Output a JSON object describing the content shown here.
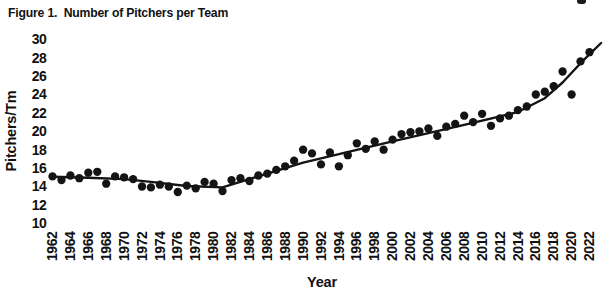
{
  "figure": {
    "title": "Figure 1.  Number of Pitchers per Team"
  },
  "chart_data": {
    "type": "scatter",
    "title": "Figure 1. Number of Pitchers per Team",
    "xlabel": "Year",
    "ylabel": "Pitchers/Tm",
    "xlim": [
      1960.5,
      2023.5
    ],
    "ylim": [
      10,
      30
    ],
    "yticks": [
      10,
      12,
      14,
      16,
      18,
      20,
      22,
      24,
      26,
      28,
      30
    ],
    "xticks": [
      1962,
      1964,
      1966,
      1968,
      1970,
      1972,
      1974,
      1976,
      1978,
      1980,
      1982,
      1984,
      1986,
      1988,
      1990,
      1992,
      1994,
      1996,
      1998,
      2000,
      2002,
      2004,
      2006,
      2008,
      2010,
      2012,
      2014,
      2016,
      2018,
      2020,
      2022
    ],
    "grid": false,
    "legend": "none",
    "point_color": "#141414",
    "line_color": "#141414",
    "series": [
      {
        "name": "pitchers-per-team-by-year",
        "type": "scatter",
        "x": [
          1962,
          1963,
          1964,
          1965,
          1966,
          1967,
          1968,
          1969,
          1970,
          1971,
          1972,
          1973,
          1974,
          1975,
          1976,
          1977,
          1978,
          1979,
          1980,
          1981,
          1982,
          1983,
          1984,
          1985,
          1986,
          1987,
          1988,
          1989,
          1990,
          1991,
          1992,
          1993,
          1994,
          1995,
          1996,
          1997,
          1998,
          1999,
          2000,
          2001,
          2002,
          2003,
          2004,
          2005,
          2006,
          2007,
          2008,
          2009,
          2010,
          2011,
          2012,
          2013,
          2014,
          2015,
          2016,
          2017,
          2018,
          2019,
          2020,
          2021,
          2022
        ],
        "y": [
          15.1,
          14.7,
          15.2,
          14.9,
          15.5,
          15.6,
          14.3,
          15.1,
          15.0,
          14.8,
          14.0,
          13.9,
          14.2,
          14.0,
          13.4,
          14.1,
          13.8,
          14.5,
          14.3,
          13.5,
          14.7,
          14.9,
          14.6,
          15.2,
          15.4,
          15.8,
          16.2,
          16.8,
          18.0,
          17.6,
          16.4,
          17.7,
          16.2,
          17.4,
          18.7,
          18.1,
          18.9,
          18.0,
          19.1,
          19.7,
          19.9,
          20.0,
          20.3,
          19.5,
          20.5,
          20.8,
          21.7,
          21.0,
          21.9,
          20.6,
          21.4,
          21.7,
          22.3,
          22.7,
          24.0,
          24.3,
          24.9,
          26.5,
          24.0,
          27.6,
          28.6
        ]
      },
      {
        "name": "trend-line",
        "type": "line",
        "x": [
          1962,
          1966,
          1970,
          1973,
          1977,
          1981,
          1990,
          2000,
          2008,
          2014,
          2017,
          2019,
          2021,
          2023.3
        ],
        "y": [
          15.05,
          14.95,
          14.8,
          14.5,
          14.05,
          13.9,
          16.6,
          18.9,
          20.7,
          22.1,
          23.6,
          25.3,
          27.4,
          29.6
        ]
      }
    ]
  }
}
